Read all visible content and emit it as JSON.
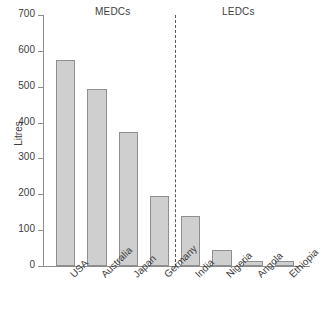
{
  "chart_data": {
    "type": "bar",
    "title": "",
    "xlabel": "",
    "ylabel": "Litres",
    "ylim": [
      0,
      700
    ],
    "yticks": [
      0,
      100,
      200,
      300,
      400,
      500,
      600,
      700
    ],
    "grid": false,
    "legend": "none",
    "categories": [
      "USA",
      "Australia",
      "Japan",
      "Germany",
      "India",
      "Nigeria",
      "Angola",
      "Ethiopia"
    ],
    "values": [
      575,
      495,
      375,
      195,
      140,
      45,
      15,
      15
    ],
    "groups": [
      {
        "label": "MEDCs",
        "categories": [
          "USA",
          "Australia",
          "Japan",
          "Germany"
        ]
      },
      {
        "label": "LEDCs",
        "categories": [
          "India",
          "Nigeria",
          "Angola",
          "Ethiopia"
        ]
      }
    ],
    "annotations": [
      {
        "type": "vertical-dashed-line",
        "between": [
          "Germany",
          "India"
        ]
      }
    ],
    "bar_color": "#cfcfcf",
    "bar_border_color": "#8f8f8f",
    "axis_color": "#8c8c8c",
    "text_color": "#3d3d3d"
  },
  "groups": {
    "medcs_label": "MEDCs",
    "ledcs_label": "LEDCs"
  },
  "axis": {
    "y_title": "Litres",
    "y_tick_labels": [
      "700",
      "600",
      "500",
      "400",
      "300",
      "200",
      "100",
      "0"
    ]
  }
}
